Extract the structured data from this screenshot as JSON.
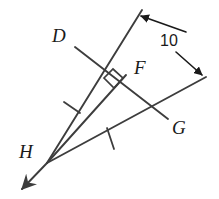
{
  "figure": {
    "type": "geometry-diagram",
    "stroke_color": "#3d3d3d",
    "label_color": "#1a1a1a",
    "background_color": "#ffffff",
    "stroke_width": 1.9
  },
  "labels": {
    "D": "D",
    "F": "F",
    "G": "G",
    "H": "H"
  },
  "measurement": {
    "value": "10",
    "description": "distance between the two parallel rays"
  },
  "points": {
    "D": {
      "x": 75,
      "y": 47
    },
    "F": {
      "x": 125,
      "y": 74
    },
    "G": {
      "x": 168,
      "y": 119
    },
    "H": {
      "x": 47,
      "y": 163
    },
    "ray_top_tip": {
      "x": 142,
      "y": 10
    },
    "ray_right_tip": {
      "x": 206,
      "y": 77
    },
    "ray_h_tip": {
      "x": 16,
      "y": 193
    },
    "perp_foot": {
      "x": 113,
      "y": 83
    }
  },
  "marks": {
    "right_angle_at": "perpendicular foot of H on segment DG",
    "tick_marks": [
      {
        "segment": "HD",
        "count": 1
      },
      {
        "segment": "HG",
        "count": 1
      }
    ]
  },
  "dimension_arrows": [
    {
      "from": {
        "x": 186,
        "y": 32
      },
      "to": {
        "x": 139,
        "y": 17
      },
      "target": "upper ray"
    },
    {
      "from": {
        "x": 176,
        "y": 52
      },
      "to": {
        "x": 201,
        "y": 74
      },
      "target": "lower ray"
    }
  ]
}
